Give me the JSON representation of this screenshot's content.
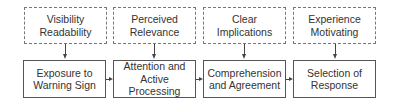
{
  "diagram": {
    "influences": [
      {
        "line1": "Visibility",
        "line2": "Readability"
      },
      {
        "line1": "Perceived",
        "line2": "Relevance"
      },
      {
        "line1": "Clear",
        "line2": "Implications"
      },
      {
        "line1": "Experience",
        "line2": "Motivating"
      }
    ],
    "stages": [
      {
        "line1": "Exposure to",
        "line2": "Warning Sign"
      },
      {
        "line1": "Attention and",
        "line2": "Active Processing"
      },
      {
        "line1": "Comprehension",
        "line2": "and Agreement"
      },
      {
        "line1": "Selection of",
        "line2": "Response"
      }
    ]
  }
}
